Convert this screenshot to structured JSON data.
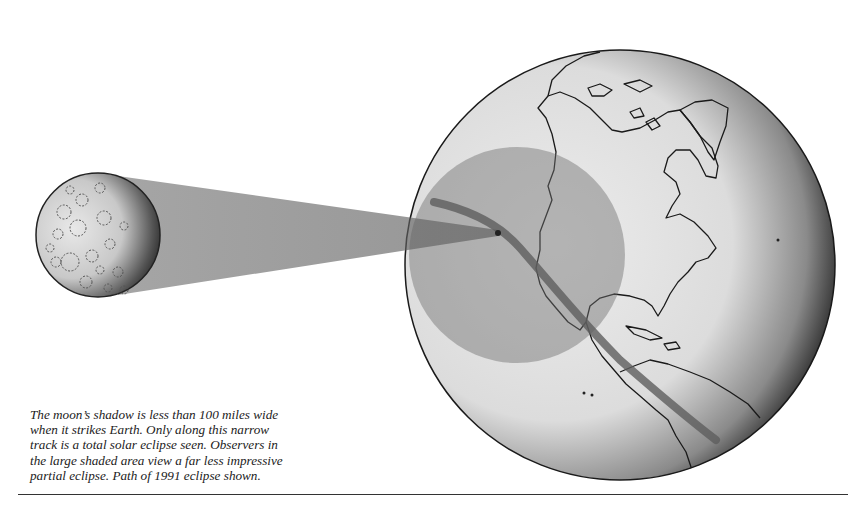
{
  "figure": {
    "elements": {
      "moon": {
        "label": "moon",
        "cx": 98,
        "cy": 235,
        "r": 62
      },
      "shadow_cone": {
        "label": "moon shadow cone"
      },
      "earth": {
        "label": "Earth globe (Americas)",
        "cx": 620,
        "cy": 265,
        "r": 215
      },
      "penumbra": {
        "label": "large shaded area (partial eclipse)",
        "cx": 517,
        "cy": 255,
        "r": 108
      },
      "totality_track": {
        "label": "narrow track of totality, 1991 eclipse path"
      }
    },
    "colors": {
      "background": "#ffffff",
      "globe_light": "#e6e6e6",
      "globe_dark": "#111111",
      "penumbra": "#8a8a8a",
      "track": "#666666",
      "outline": "#1a1a1a"
    }
  },
  "caption": {
    "lines": [
      "The moon’s shadow is less than 100 miles wide",
      "when it strikes Earth. Only along this narrow",
      "track is a total solar eclipse seen. Observers in",
      "the large shaded area view a far less impressive",
      "partial eclipse. Path of 1991 eclipse shown."
    ]
  }
}
